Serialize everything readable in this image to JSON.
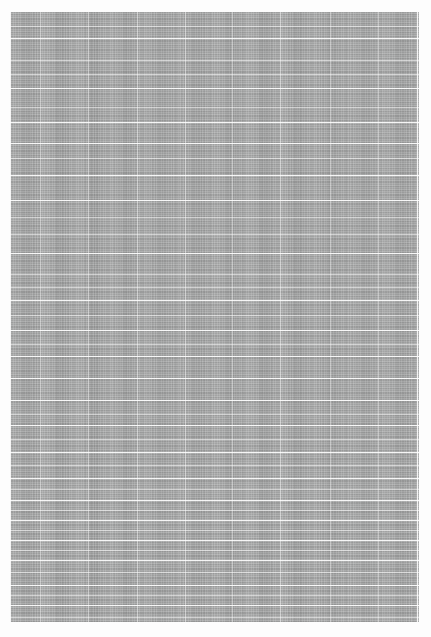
{
  "page": {
    "kind": "dense-data-table-page",
    "width": 431,
    "height": 637,
    "background_color": "#fdfdfd",
    "legibility_note": "Body text is rendered below the resolution limit; no glyphs, labels, headers or cell values are legible at any magnification. Only the ruling grid and text-block texture are recoverable.",
    "text_content_legible": false
  },
  "content_block": {
    "name": "table-body",
    "left": 10,
    "top": 12,
    "width": 409,
    "height": 610,
    "fill_color": "#9fa0a0",
    "rule_color": "#ffffff",
    "approx_text_line_pitch_px": 4.4,
    "approx_text_line_count": 138
  },
  "column_rules_x": [
    0,
    30,
    78,
    127,
    175,
    222,
    270,
    320,
    368,
    407
  ],
  "row_rules_y": [
    26,
    76,
    110,
    131,
    163,
    188,
    241,
    288,
    318,
    344,
    366,
    388,
    413,
    440,
    466,
    488,
    508,
    528,
    548,
    573,
    593
  ],
  "soft_row_rules_y": [
    14,
    48,
    62,
    95,
    146,
    205,
    222,
    262,
    275,
    303,
    332,
    402,
    427,
    453,
    477,
    498,
    518,
    538,
    560,
    583,
    605
  ]
}
